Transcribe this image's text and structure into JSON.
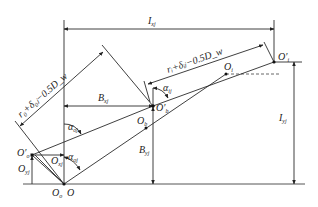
{
  "figure": {
    "type": "geometric-kinematic-diagram",
    "labels": {
      "Ixj": {
        "main": "I",
        "sub": "xj"
      },
      "Iyj": {
        "main": "I",
        "sub": "yj"
      },
      "Bxj": {
        "main": "B",
        "sub": "xj"
      },
      "Byj": {
        "main": "B",
        "sub": "yj"
      },
      "Oxj": {
        "main": "O",
        "sub": "xj"
      },
      "Oyj": {
        "main": "O",
        "sub": "yj"
      },
      "alpha_oj_upper": {
        "main": "α",
        "sub": "oj"
      },
      "alpha_oj_lower": {
        "main": "α",
        "sub": "oj"
      },
      "alpha_ij": {
        "main": "α",
        "sub": "ij"
      },
      "O": {
        "main": "O"
      },
      "Oo": {
        "main": "O",
        "sub": "o"
      },
      "Oo_prime": {
        "main": "O′",
        "sub": "o"
      },
      "Ob": {
        "main": "O",
        "sub": "b"
      },
      "Ob_prime": {
        "main": "O′",
        "sub": "b"
      },
      "Oi": {
        "main": "O",
        "sub": "i"
      },
      "Oi_prime": {
        "main": "O′",
        "sub": "i"
      },
      "outer_radius_expr": "r₀+δ₀ⱼ−0.5D_w",
      "inner_radius_expr": "rᵢ+δᵢⱼ−0.5D_w"
    }
  }
}
